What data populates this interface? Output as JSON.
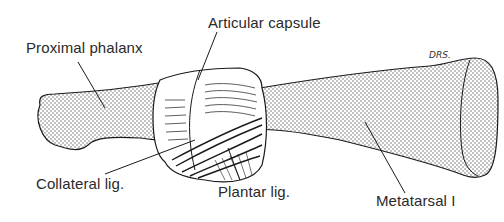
{
  "figure": {
    "labels": {
      "proximal_phalanx": "Proximal phalanx",
      "articular_capsule": "Articular capsule",
      "collateral_lig": "Collateral lig.",
      "plantar_lig": "Plantar lig.",
      "metatarsal": "Metatarsal I"
    },
    "signature": "DRS.",
    "colors": {
      "ink": "#1a1a1a",
      "text": "#2a2a2a",
      "stipple": "#555555",
      "background": "#ffffff"
    }
  }
}
